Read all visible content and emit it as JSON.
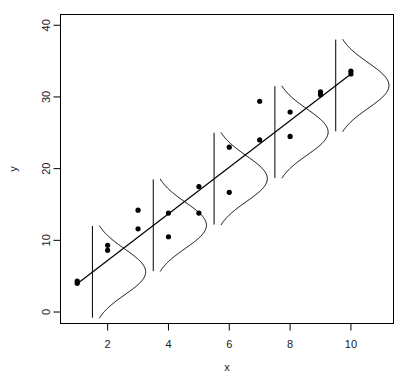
{
  "chart_data": {
    "type": "scatter",
    "title": "",
    "subtitle": "",
    "xlabel": "x",
    "ylabel": "y",
    "xlim": [
      0.45,
      11.4
    ],
    "ylim": [
      -1.6,
      41.5
    ],
    "xticks": [
      2,
      4,
      6,
      8,
      10
    ],
    "yticks": [
      0,
      10,
      20,
      30,
      40
    ],
    "xtick_labels": [
      "2",
      "4",
      "6",
      "8",
      "10"
    ],
    "ytick_labels": [
      "0",
      "10",
      "20",
      "30",
      "40"
    ],
    "grid": false,
    "legend": "none",
    "frame": "box",
    "point_color": "#000000",
    "line_color": "#000000",
    "curve_color": "#000000",
    "axis_color": "#000000",
    "background": "#ffffff",
    "points": [
      {
        "x": 1,
        "y": 4.0
      },
      {
        "x": 1,
        "y": 4.3
      },
      {
        "x": 2,
        "y": 8.6
      },
      {
        "x": 2,
        "y": 9.3
      },
      {
        "x": 3,
        "y": 14.2
      },
      {
        "x": 3,
        "y": 11.6
      },
      {
        "x": 4,
        "y": 13.8
      },
      {
        "x": 4,
        "y": 10.5
      },
      {
        "x": 5,
        "y": 13.8
      },
      {
        "x": 5,
        "y": 17.5
      },
      {
        "x": 6,
        "y": 23.0
      },
      {
        "x": 6,
        "y": 16.7
      },
      {
        "x": 7,
        "y": 29.4
      },
      {
        "x": 7,
        "y": 24.0
      },
      {
        "x": 8,
        "y": 27.9
      },
      {
        "x": 8,
        "y": 24.5
      },
      {
        "x": 9,
        "y": 30.3
      },
      {
        "x": 9,
        "y": 30.7
      },
      {
        "x": 10,
        "y": 33.2
      },
      {
        "x": 10,
        "y": 33.6
      }
    ],
    "regression_line": {
      "intercept": 0.7,
      "slope": 3.25,
      "x_start": 1,
      "x_end": 10
    },
    "density_curves": {
      "description": "normal density curves drawn sideways on vertical baselines at each x, centered on the fitted line",
      "centers_x": [
        1.5,
        3.5,
        5.5,
        7.5,
        9.5
      ],
      "centers_y": [
        5.6,
        12.1,
        18.6,
        25.1,
        31.6
      ],
      "sd": 3.2,
      "half_span_sd": 2.0,
      "amplitude_x_units": 1.75
    }
  },
  "axes": {
    "x_title": "x",
    "y_title": "y"
  }
}
